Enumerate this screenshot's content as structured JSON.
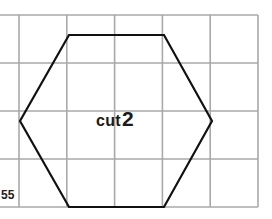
{
  "diagram": {
    "grid": {
      "columns": 5,
      "rows": 4,
      "left": 19,
      "top": 15,
      "right": 258,
      "bottom": 207,
      "line_color": "#a9a9a9"
    },
    "shape": {
      "type": "hexagon",
      "stroke_color": "#111111",
      "points": [
        [
          69,
          35
        ],
        [
          164,
          35
        ],
        [
          212,
          121
        ],
        [
          164,
          207
        ],
        [
          69,
          207
        ],
        [
          20,
          121
        ]
      ]
    },
    "label": {
      "word": "cut",
      "number": "2"
    },
    "page_number": "55"
  }
}
